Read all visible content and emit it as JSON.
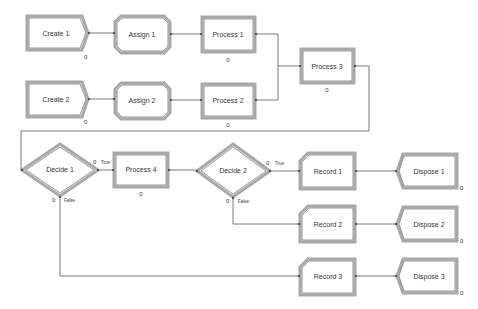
{
  "diagram": {
    "type": "Arena simulation flowchart",
    "modules": {
      "create1": {
        "label": "Create 1",
        "count": "0"
      },
      "create2": {
        "label": "Create 2",
        "count": "0"
      },
      "assign1": {
        "label": "Assign 1"
      },
      "assign2": {
        "label": "Assign 2"
      },
      "process1": {
        "label": "Process 1",
        "count": "0"
      },
      "process2": {
        "label": "Process 2",
        "count": "0"
      },
      "process3": {
        "label": "Process 3",
        "count": "0"
      },
      "process4": {
        "label": "Process 4",
        "count": "0"
      },
      "decide1": {
        "label": "Decide 1",
        "true_count": "0",
        "false_count": "0",
        "true_label": "True",
        "false_label": "False"
      },
      "decide2": {
        "label": "Decide 2",
        "true_count": "0",
        "false_count": "0",
        "true_label": "True",
        "false_label": "False"
      },
      "record1": {
        "label": "Record 1"
      },
      "record2": {
        "label": "Record 2"
      },
      "record3": {
        "label": "Record 3"
      },
      "dispose1": {
        "label": "Dispose 1",
        "count": "0"
      },
      "dispose2": {
        "label": "Dispose 2",
        "count": "0"
      },
      "dispose3": {
        "label": "Dispose 3",
        "count": "0"
      }
    },
    "connections": [
      [
        "Create 1",
        "Assign 1"
      ],
      [
        "Assign 1",
        "Process 1"
      ],
      [
        "Process 1",
        "Process 3"
      ],
      [
        "Create 2",
        "Assign 2"
      ],
      [
        "Assign 2",
        "Process 2"
      ],
      [
        "Process 2",
        "Process 3"
      ],
      [
        "Process 3",
        "Decide 1"
      ],
      [
        "Decide 1",
        "Process 4"
      ],
      [
        "Decide 1",
        "Record 3"
      ],
      [
        "Process 4",
        "Decide 2"
      ],
      [
        "Decide 2",
        "Record 1"
      ],
      [
        "Decide 2",
        "Record 2"
      ],
      [
        "Record 1",
        "Dispose 1"
      ],
      [
        "Record 2",
        "Dispose 2"
      ],
      [
        "Record 3",
        "Dispose 3"
      ]
    ]
  }
}
